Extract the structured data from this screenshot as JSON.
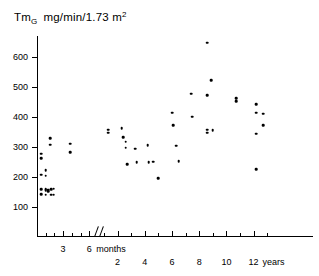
{
  "chart_data": {
    "type": "scatter",
    "title_parts": {
      "symbol": "Tm",
      "subscript": "G",
      "units": "mg/min/1.73 m",
      "superscript": "2"
    },
    "xlabel": "",
    "ylabel": "",
    "ylim": [
      0,
      650
    ],
    "yticks": [
      100,
      200,
      300,
      400,
      500,
      600
    ],
    "ytick_labels": [
      "100",
      "200",
      "300",
      "400",
      "500",
      "600"
    ],
    "grid": false,
    "legend": null,
    "axis_break": true,
    "x_axis_segments": [
      {
        "unit_label": "months",
        "ticks": [
          1,
          2,
          3,
          4,
          5,
          6
        ],
        "labeled_ticks": [
          3,
          6
        ],
        "labels": [
          "3",
          "6"
        ]
      },
      {
        "unit_label": "years",
        "ticks": [
          1,
          2,
          3,
          4,
          5,
          6,
          7,
          8,
          9,
          10,
          11,
          12,
          13
        ],
        "labeled_ticks": [
          2,
          4,
          6,
          8,
          10,
          12
        ],
        "labels": [
          "2",
          "4",
          "6",
          "8",
          "10",
          "12"
        ]
      }
    ],
    "points_months": [
      {
        "x": 0.5,
        "y": 278
      },
      {
        "x": 0.5,
        "y": 263
      },
      {
        "x": 0.5,
        "y": 208
      },
      {
        "x": 0.5,
        "y": 160
      },
      {
        "x": 0.5,
        "y": 143
      },
      {
        "x": 1.0,
        "y": 222
      },
      {
        "x": 1.0,
        "y": 204
      },
      {
        "x": 1.0,
        "y": 160
      },
      {
        "x": 1.0,
        "y": 156
      },
      {
        "x": 1.0,
        "y": 141
      },
      {
        "x": 1.3,
        "y": 158
      },
      {
        "x": 1.3,
        "y": 152
      },
      {
        "x": 1.5,
        "y": 330
      },
      {
        "x": 1.5,
        "y": 308
      },
      {
        "x": 1.6,
        "y": 160
      },
      {
        "x": 1.6,
        "y": 141
      },
      {
        "x": 1.9,
        "y": 161
      },
      {
        "x": 1.9,
        "y": 141
      },
      {
        "x": 3.8,
        "y": 311
      },
      {
        "x": 3.8,
        "y": 282
      }
    ],
    "points_years": [
      {
        "x": 1.3,
        "y": 358
      },
      {
        "x": 1.3,
        "y": 348
      },
      {
        "x": 2.3,
        "y": 362
      },
      {
        "x": 2.4,
        "y": 333
      },
      {
        "x": 2.6,
        "y": 317
      },
      {
        "x": 2.6,
        "y": 298
      },
      {
        "x": 2.7,
        "y": 242
      },
      {
        "x": 3.3,
        "y": 294
      },
      {
        "x": 3.4,
        "y": 250
      },
      {
        "x": 4.2,
        "y": 306
      },
      {
        "x": 4.3,
        "y": 250
      },
      {
        "x": 4.6,
        "y": 251
      },
      {
        "x": 5.0,
        "y": 196
      },
      {
        "x": 6.0,
        "y": 415
      },
      {
        "x": 6.1,
        "y": 373
      },
      {
        "x": 6.3,
        "y": 305
      },
      {
        "x": 6.5,
        "y": 252
      },
      {
        "x": 7.4,
        "y": 477
      },
      {
        "x": 7.5,
        "y": 401
      },
      {
        "x": 8.6,
        "y": 648
      },
      {
        "x": 8.6,
        "y": 472
      },
      {
        "x": 8.6,
        "y": 357
      },
      {
        "x": 8.6,
        "y": 348
      },
      {
        "x": 8.9,
        "y": 523
      },
      {
        "x": 9.0,
        "y": 356
      },
      {
        "x": 10.7,
        "y": 462
      },
      {
        "x": 10.7,
        "y": 453
      },
      {
        "x": 12.2,
        "y": 442
      },
      {
        "x": 12.2,
        "y": 414
      },
      {
        "x": 12.2,
        "y": 345
      },
      {
        "x": 12.2,
        "y": 226
      },
      {
        "x": 12.7,
        "y": 411
      },
      {
        "x": 12.7,
        "y": 373
      }
    ]
  }
}
